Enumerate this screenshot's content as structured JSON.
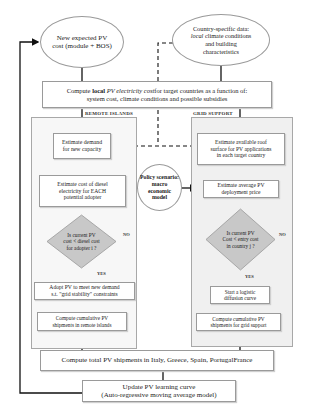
{
  "diagram": {
    "top_left_ellipse": {
      "line1": "New expected PV",
      "line2": "cost (module + BOS)"
    },
    "top_right_ellipse": {
      "line1": "Country-specific data:",
      "line2_italic": "local",
      "line2_rest": " climate conditions",
      "line3": "and building",
      "line4": "characteristics"
    },
    "compute_local": {
      "prefix": "Compute ",
      "bold": "local",
      "italic": " PV electricity cost",
      "rest": "for target countries as a function of:",
      "line2": "system cost, climate conditions and possible subsidies"
    },
    "panels": {
      "remote": {
        "label": "REMOTE ISLANDS"
      },
      "grid": {
        "label": "GRID SUPPORT"
      }
    },
    "remote_steps": {
      "estimate_demand": {
        "line1": "Estimate demand",
        "line2": "for new capacity"
      },
      "estimate_diesel": {
        "line1": "Estimate cost of diesel",
        "line2": "electricity for EACH",
        "line3": "potential adopter"
      },
      "decision": {
        "line1": "Is current PV",
        "line2": "cost < diesel cost",
        "line3": "for adopter i ?"
      },
      "no_label": "NO",
      "yes_label": "YES",
      "adopt": {
        "line1": "Adopt PV to meet new demand",
        "line2": "s.t. \"grid stability\" constraints"
      },
      "cumulative": {
        "line1": "Compute cumulative PV",
        "line2": "shipments in remote islands"
      }
    },
    "grid_steps": {
      "roof_surface": {
        "line1": "Estimate available roof",
        "line2": "surface for PV applications",
        "line3": "in each target country"
      },
      "deployment_price": {
        "line1": "Estimate average PV",
        "line2": "deployment price"
      },
      "decision": {
        "line1": "Is current PV",
        "line2": "Cost < entry cost",
        "line3": "in country j ?"
      },
      "no_label": "NO",
      "yes_label": "YES",
      "logistic": {
        "line1": "Start a logistic",
        "line2": "diffusion curve"
      },
      "cumulative": {
        "line1": "Compute cumulative PV",
        "line2": "shipments for grid support"
      }
    },
    "policy_circle": {
      "line1": "Policy scenario:",
      "line2": "macro",
      "line3": "economic",
      "line4": "model"
    },
    "total_shipments": {
      "text": "Compute total PV shipments in Italy, Greece, Spain, PortugalFrance"
    },
    "learning_curve": {
      "line1": "Update PV learning curve",
      "line2": "(Auto-regressive moving average model)"
    }
  }
}
